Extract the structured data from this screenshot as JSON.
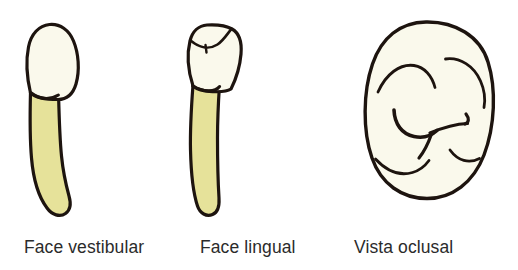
{
  "figure": {
    "background_color": "#ffffff",
    "panels": [
      {
        "id": "vestibular",
        "caption": "Face vestibular",
        "view": "buccal-view",
        "parts": [
          "crown",
          "root"
        ],
        "crown_color": "#faf9ec",
        "root_color": "#e6e29a",
        "outline_color": "#1d140f"
      },
      {
        "id": "lingual",
        "caption": "Face lingual",
        "view": "lingual-view",
        "parts": [
          "crown",
          "root"
        ],
        "crown_color": "#faf9ec",
        "root_color": "#e6e29a",
        "outline_color": "#1d140f"
      },
      {
        "id": "occlusal",
        "caption": "Vista oclusal",
        "view": "occlusal-view",
        "parts": [
          "occlusal-surface",
          "fissure-grooves",
          "marginal-ridges"
        ],
        "surface_color": "#faf9ec",
        "outline_color": "#1d140f"
      }
    ]
  },
  "captions": {
    "vestibular": "Face vestibular",
    "lingual": "Face lingual",
    "occlusal": "Vista oclusal"
  },
  "colors": {
    "enamel": "#faf9ec",
    "dentin_root": "#e6e29a",
    "outline": "#1d140f",
    "text": "#2b2b2b",
    "background": "#ffffff"
  }
}
